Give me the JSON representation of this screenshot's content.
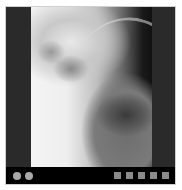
{
  "viewer": {
    "image_label": "X-ray thumbnail",
    "side_marker": "L"
  },
  "controls": {
    "left_dots": [
      "dot-1",
      "dot-2"
    ],
    "right_squares": [
      "square-1",
      "square-2",
      "square-3",
      "square-4",
      "square-5"
    ],
    "colors": {
      "dot": "#a8a8a8",
      "square": "#8a8a8a",
      "bar": "#000000",
      "panel": "#2a2a2a"
    }
  }
}
